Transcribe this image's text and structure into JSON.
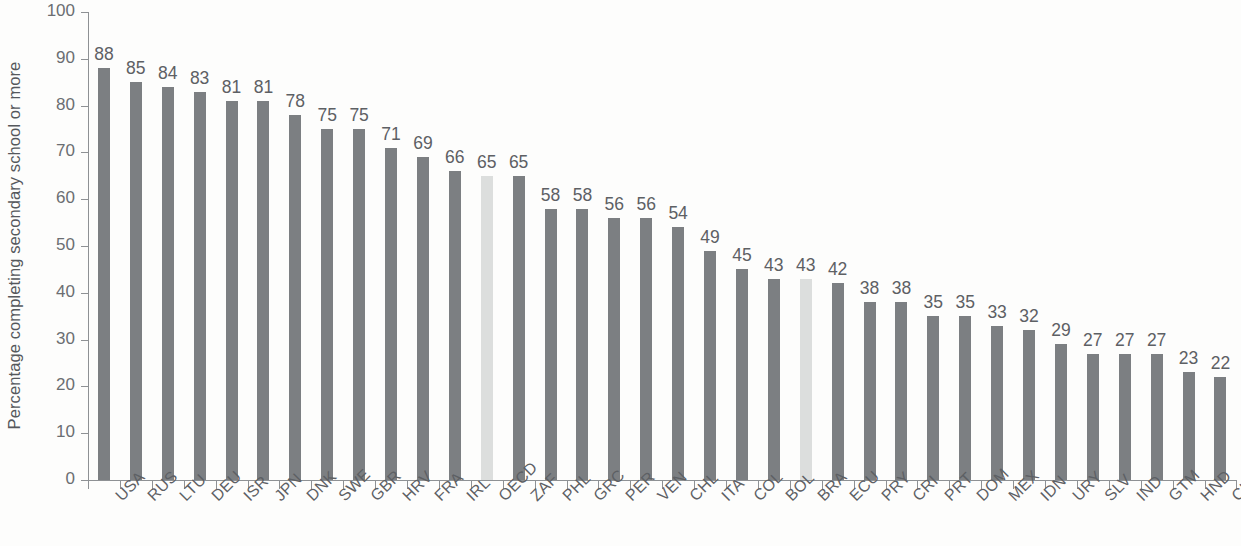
{
  "chart_data": {
    "type": "bar",
    "title": "",
    "subtitle": "",
    "xlabel": "",
    "ylabel": "Percentage completing secondary school or more",
    "ylim": [
      0,
      100
    ],
    "ytick_labels": [
      "0",
      "10",
      "20",
      "30",
      "40",
      "50",
      "60",
      "70",
      "80",
      "90",
      "100"
    ],
    "ytick_values": [
      0,
      10,
      20,
      30,
      40,
      50,
      60,
      70,
      80,
      90,
      100
    ],
    "grid": false,
    "legend": null,
    "categories": [
      "USA",
      "RUS",
      "LTU",
      "DEU",
      "ISR",
      "JPN",
      "DNK",
      "SWE",
      "GBR",
      "HRV",
      "FRA",
      "IRL",
      "OECD",
      "ZAF",
      "PHL",
      "GRC",
      "PER",
      "VEN",
      "CHL",
      "ITA",
      "COL",
      "BOL",
      "BRA",
      "ECU",
      "PRY",
      "CRI",
      "PRT",
      "DOM",
      "MEX",
      "IDN",
      "URY",
      "SLV",
      "IND",
      "GTM",
      "HND",
      "CHN"
    ],
    "values": [
      88,
      85,
      84,
      83,
      81,
      81,
      78,
      75,
      75,
      71,
      69,
      66,
      65,
      65,
      58,
      58,
      56,
      56,
      54,
      49,
      45,
      43,
      43,
      42,
      38,
      38,
      35,
      35,
      33,
      32,
      29,
      27,
      27,
      27,
      23,
      22
    ],
    "value_labels": [
      "88",
      "85",
      "84",
      "83",
      "81",
      "81",
      "78",
      "75",
      "75",
      "71",
      "69",
      "66",
      "65",
      "65",
      "58",
      "58",
      "56",
      "56",
      "54",
      "49",
      "45",
      "43",
      "43",
      "42",
      "38",
      "38",
      "35",
      "35",
      "33",
      "32",
      "29",
      "27",
      "27",
      "27",
      "23",
      "22"
    ],
    "highlighted_categories": [
      "OECD",
      "BRA"
    ],
    "colors": {
      "bar": "#7c7f82",
      "bar_highlight": "#dcdedd",
      "axis": "#8e9194",
      "text": "#5d6064",
      "background": "#fdfdfc"
    }
  }
}
